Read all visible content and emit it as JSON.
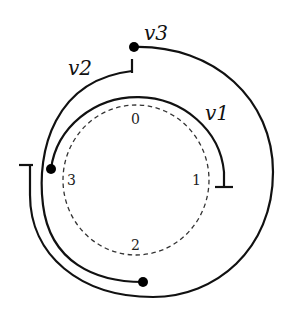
{
  "diagram": {
    "ring_labels": {
      "n0": "0",
      "n1": "1",
      "n2": "2",
      "n3": "3"
    },
    "interval_labels": {
      "v1": "v1",
      "v2": "v2",
      "v3": "v3"
    },
    "colors": {
      "stroke": "#111111",
      "dashed": "#333333",
      "background": "#ffffff"
    }
  }
}
